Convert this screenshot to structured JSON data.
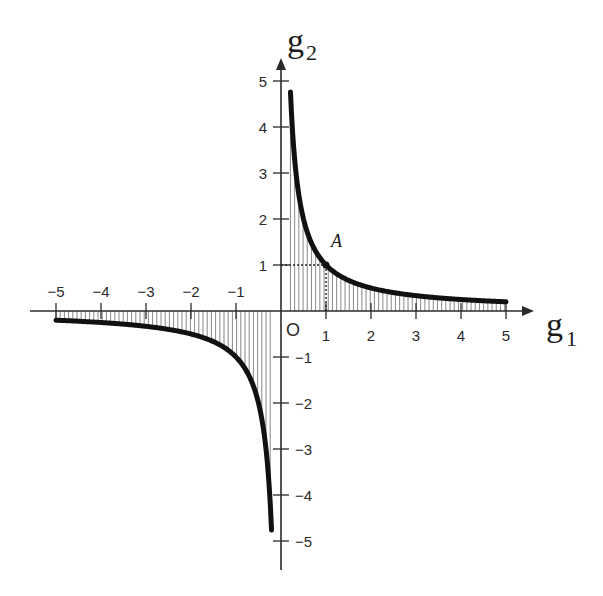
{
  "chart_data": {
    "type": "line",
    "title": "",
    "xlabel": "g1",
    "ylabel": "g2",
    "xlabel_main": "g",
    "xlabel_sub": "1",
    "ylabel_main": "g",
    "ylabel_sub": "2",
    "function": "g2 = 1 / g1",
    "xlim": [
      -5,
      5
    ],
    "ylim": [
      -5,
      5
    ],
    "x_ticks": [
      -5,
      -4,
      -3,
      -2,
      -1,
      1,
      2,
      3,
      4,
      5
    ],
    "y_ticks": [
      -5,
      -4,
      -3,
      -2,
      -1,
      1,
      2,
      3,
      4,
      5
    ],
    "origin_label": "O",
    "grid": false,
    "shading": "vertical hatching between curve and g1-axis",
    "series": [
      {
        "name": "positive branch",
        "x": [
          0.21,
          0.25,
          0.3,
          0.4,
          0.5,
          0.75,
          1,
          1.5,
          2,
          2.5,
          3,
          3.5,
          4,
          4.5,
          5
        ],
        "values": [
          4.76,
          4.0,
          3.33,
          2.5,
          2.0,
          1.33,
          1.0,
          0.67,
          0.5,
          0.4,
          0.33,
          0.29,
          0.25,
          0.22,
          0.2
        ]
      },
      {
        "name": "negative branch",
        "x": [
          -5,
          -4.5,
          -4,
          -3.5,
          -3,
          -2.5,
          -2,
          -1.5,
          -1,
          -0.75,
          -0.5,
          -0.4,
          -0.3,
          -0.25,
          -0.21
        ],
        "values": [
          -0.2,
          -0.22,
          -0.25,
          -0.29,
          -0.33,
          -0.4,
          -0.5,
          -0.67,
          -1.0,
          -1.33,
          -2.0,
          -2.5,
          -3.33,
          -4.0,
          -4.76
        ]
      }
    ],
    "annotations": [
      {
        "label": "A",
        "x": 1,
        "y": 1,
        "guides": "dotted lines to both axes"
      }
    ]
  },
  "colors": {
    "curve": "#111111",
    "axis": "#2a2a2a",
    "hatch": "#555555",
    "background": "#ffffff"
  }
}
